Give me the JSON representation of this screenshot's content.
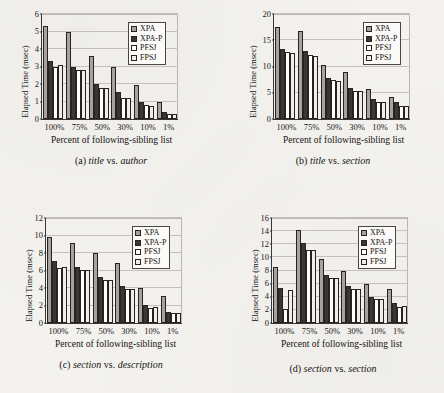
{
  "figure": {
    "common": {
      "xlabel": "Percent of following-sibling list",
      "ylabel": "Elapsed Time (msec)",
      "categories": [
        "100%",
        "75%",
        "50%",
        "30%",
        "10%",
        "1%"
      ],
      "legend": [
        {
          "name": "XPA",
          "color": "#a7a29b"
        },
        {
          "name": "XPA-P",
          "color": "#3b3833"
        },
        {
          "name": "PFSJ",
          "color": "#ffffff"
        },
        {
          "name": "FPSJ",
          "color": "#f0eee9"
        }
      ]
    },
    "panels": [
      {
        "id": "a",
        "caption_prefix": "(a) ",
        "caption_left": "title",
        "caption_vs": " vs. ",
        "caption_right": "author",
        "caption_full": "(a) title vs. author"
      },
      {
        "id": "b",
        "caption_prefix": "(b) ",
        "caption_left": "title",
        "caption_vs": " vs. ",
        "caption_right": "section",
        "caption_full": "(b) title vs. section"
      },
      {
        "id": "c",
        "caption_prefix": "(c) ",
        "caption_left": "section",
        "caption_vs": " vs. ",
        "caption_right": "description",
        "caption_full": "(c) section vs. description"
      },
      {
        "id": "d",
        "caption_prefix": "(d) ",
        "caption_left": "section",
        "caption_vs": " vs. ",
        "caption_right": "section",
        "caption_full": "(d) section vs. section"
      }
    ]
  },
  "chart_data": [
    {
      "type": "bar",
      "panel": "a",
      "title": "(a) title vs. author",
      "xlabel": "Percent of following-sibling list",
      "ylabel": "Elapsed Time (msec)",
      "categories": [
        "100%",
        "75%",
        "50%",
        "30%",
        "10%",
        "1%"
      ],
      "ylim": [
        0,
        6
      ],
      "yticks": [
        0,
        1,
        2,
        3,
        4,
        5,
        6
      ],
      "grid": true,
      "legend_position": "top-right",
      "series": [
        {
          "name": "XPA",
          "values": [
            5.3,
            4.95,
            3.6,
            2.95,
            1.95,
            1.0
          ]
        },
        {
          "name": "XPA-P",
          "values": [
            3.3,
            3.0,
            2.0,
            1.55,
            1.0,
            0.4
          ]
        },
        {
          "name": "PFSJ",
          "values": [
            2.95,
            2.8,
            1.8,
            1.2,
            0.78,
            0.28
          ]
        },
        {
          "name": "FPSJ",
          "values": [
            3.1,
            2.78,
            1.78,
            1.18,
            0.76,
            0.27
          ]
        }
      ]
    },
    {
      "type": "bar",
      "panel": "b",
      "title": "(b) title vs. section",
      "xlabel": "Percent of following-sibling list",
      "ylabel": "Elapsed Time (msec)",
      "categories": [
        "100%",
        "75%",
        "50%",
        "30%",
        "10%",
        "1%"
      ],
      "ylim": [
        0,
        20
      ],
      "yticks": [
        0,
        5,
        10,
        15,
        20
      ],
      "grid": true,
      "legend_position": "top-right",
      "series": [
        {
          "name": "XPA",
          "values": [
            17.5,
            16.7,
            10.2,
            8.9,
            5.8,
            4.1
          ]
        },
        {
          "name": "XPA-P",
          "values": [
            13.4,
            12.9,
            7.9,
            5.9,
            3.9,
            3.2
          ]
        },
        {
          "name": "PFSJ",
          "values": [
            12.8,
            12.1,
            7.4,
            5.4,
            3.3,
            2.4
          ]
        },
        {
          "name": "FPSJ",
          "values": [
            12.6,
            12.0,
            7.3,
            5.4,
            3.3,
            2.4
          ]
        }
      ]
    },
    {
      "type": "bar",
      "panel": "c",
      "title": "(c) section vs. description",
      "xlabel": "Percent of following-sibling list",
      "ylabel": "Elapsed Time (msec)",
      "categories": [
        "100%",
        "75%",
        "50%",
        "30%",
        "10%",
        "1%"
      ],
      "ylim": [
        0,
        12
      ],
      "yticks": [
        0,
        2,
        4,
        6,
        8,
        10,
        12
      ],
      "grid": true,
      "legend_position": "top-right",
      "series": [
        {
          "name": "XPA",
          "values": [
            9.85,
            9.2,
            7.95,
            6.85,
            4.0,
            3.05
          ]
        },
        {
          "name": "XPA-P",
          "values": [
            7.05,
            6.45,
            5.3,
            4.25,
            2.05,
            1.3
          ]
        },
        {
          "name": "PFSJ",
          "values": [
            6.3,
            6.05,
            4.9,
            3.85,
            1.75,
            1.2
          ]
        },
        {
          "name": "FPSJ",
          "values": [
            6.4,
            6.1,
            4.95,
            3.85,
            1.8,
            1.2
          ]
        }
      ]
    },
    {
      "type": "bar",
      "panel": "d",
      "title": "(d) section vs. section",
      "xlabel": "Percent of following-sibling list",
      "ylabel": "Elapsed Time (msec)",
      "categories": [
        "100%",
        "75%",
        "50%",
        "30%",
        "10%",
        "1%"
      ],
      "ylim": [
        0,
        16
      ],
      "yticks": [
        0,
        2,
        4,
        6,
        8,
        10,
        12,
        14,
        16
      ],
      "grid": true,
      "legend_position": "top-right",
      "series": [
        {
          "name": "XPA",
          "values": [
            8.6,
            14.2,
            9.7,
            8.0,
            6.0,
            5.2
          ]
        },
        {
          "name": "XPA-P",
          "values": [
            5.4,
            12.2,
            7.3,
            5.6,
            4.0,
            3.1
          ]
        },
        {
          "name": "PFSJ",
          "values": [
            2.2,
            11.2,
            6.8,
            5.2,
            3.6,
            2.4
          ]
        },
        {
          "name": "FPSJ",
          "values": [
            5.0,
            11.1,
            6.8,
            5.2,
            3.6,
            2.6
          ]
        }
      ]
    }
  ]
}
